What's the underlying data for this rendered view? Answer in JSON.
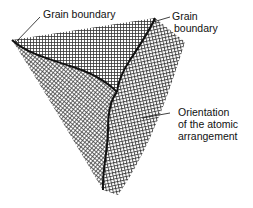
{
  "diagram": {
    "labels": {
      "top_left": "Grain boundary",
      "top_right_line1": "Grain",
      "top_right_line2": "boundary",
      "right_line1": "Orientation",
      "right_line2": "of the atomic",
      "right_line3": "arrangement"
    },
    "grains": [
      {
        "name": "top-grain",
        "pattern": "square-grid-horizontal"
      },
      {
        "name": "left-grain",
        "pattern": "diagonal-grid"
      },
      {
        "name": "right-grain",
        "pattern": "tilted-grid"
      }
    ],
    "colors": {
      "ink": "#111111",
      "background": "#ffffff"
    }
  }
}
